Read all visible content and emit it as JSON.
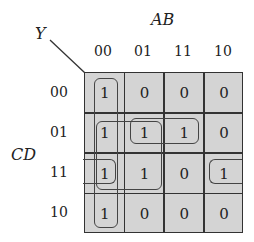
{
  "output_label": "Y",
  "col_var_label": "AB",
  "row_var_label": "CD",
  "col_headers": [
    "00",
    "01",
    "11",
    "10"
  ],
  "row_headers": [
    "00",
    "01",
    "11",
    "10"
  ],
  "cells": [
    [
      "1",
      "0",
      "0",
      "0"
    ],
    [
      "1",
      "1",
      "1",
      "0"
    ],
    [
      "1",
      "1",
      "0",
      "1"
    ],
    [
      "1",
      "0",
      "0",
      "0"
    ]
  ],
  "groupings": [
    {
      "name": "column-00-quad",
      "cells": [
        [
          0,
          0
        ],
        [
          1,
          0
        ],
        [
          2,
          0
        ],
        [
          3,
          0
        ]
      ]
    },
    {
      "name": "quad-rows01-11-cols00-01",
      "cells": [
        [
          1,
          0
        ],
        [
          1,
          1
        ],
        [
          2,
          0
        ],
        [
          2,
          1
        ]
      ]
    },
    {
      "name": "pair-row01-cols01-11",
      "cells": [
        [
          1,
          1
        ],
        [
          1,
          2
        ]
      ]
    },
    {
      "name": "wrap-pair-row11-cols00-10",
      "cells": [
        [
          2,
          0
        ],
        [
          2,
          3
        ]
      ]
    }
  ],
  "colors": {
    "cell_fill": "#d4d4d4",
    "lines": "#333333"
  }
}
